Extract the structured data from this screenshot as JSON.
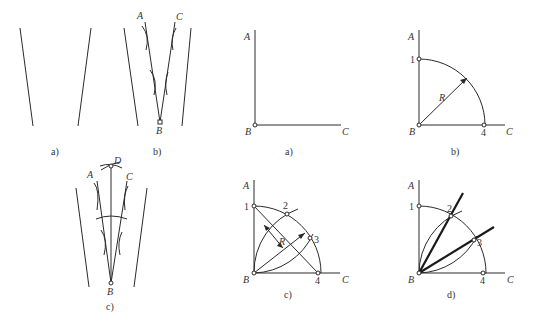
{
  "figure_left": {
    "panels": [
      {
        "id": "a",
        "caption": "a)"
      },
      {
        "id": "b",
        "caption": "b)",
        "labels": {
          "A": "A",
          "C": "C",
          "B": "B"
        }
      },
      {
        "id": "c",
        "caption": "c)",
        "labels": {
          "A": "A",
          "C": "C",
          "B": "B",
          "D": "D"
        }
      }
    ]
  },
  "figure_right": {
    "panels": [
      {
        "id": "a",
        "caption": "a)",
        "labels": {
          "A": "A",
          "B": "B",
          "C": "C"
        }
      },
      {
        "id": "b",
        "caption": "b)",
        "labels": {
          "A": "A",
          "B": "B",
          "C": "C",
          "p1": "1",
          "p4": "4",
          "R": "R"
        }
      },
      {
        "id": "c",
        "caption": "c)",
        "labels": {
          "A": "A",
          "B": "B",
          "C": "C",
          "p1": "1",
          "p2": "2",
          "p3": "3",
          "p4": "4",
          "R": "R"
        }
      },
      {
        "id": "d",
        "caption": "d)",
        "labels": {
          "A": "A",
          "B": "B",
          "C": "C",
          "p1": "1",
          "p2": "2",
          "p3": "3",
          "p4": "4"
        }
      }
    ]
  },
  "colors": {
    "line": "#2a2a2a",
    "background": "#ffffff"
  }
}
